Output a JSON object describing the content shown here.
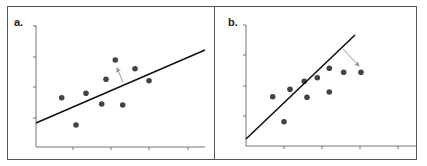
{
  "panels": [
    {
      "label": "a.",
      "line": {
        "x1": 36,
        "y1": 123,
        "x2": 205,
        "y2": 50
      },
      "points": [
        [
          61.7,
          97.7
        ],
        [
          76,
          125
        ],
        [
          86,
          93.3
        ],
        [
          101.7,
          104
        ],
        [
          106,
          79.3
        ],
        [
          115.3,
          60
        ],
        [
          122.7,
          105
        ],
        [
          135,
          68.7
        ],
        [
          149,
          80.7
        ]
      ],
      "arrow": {
        "x1": 123,
        "y1": 82,
        "x2": 117,
        "y2": 68
      },
      "axis": {
        "x": 36,
        "ytop": 25,
        "ybottom": 147,
        "xright": 205,
        "yticks": [
          26,
          57,
          87,
          118
        ],
        "xticks": [
          73,
          111,
          149,
          188
        ]
      }
    },
    {
      "label": "b.",
      "line": {
        "x1": 246,
        "y1": 139,
        "x2": 355,
        "y2": 35
      },
      "points": [
        [
          272.7,
          96.7
        ],
        [
          284,
          121.7
        ],
        [
          290,
          89.3
        ],
        [
          304.3,
          81.3
        ],
        [
          307,
          97.3
        ],
        [
          317.3,
          77.7
        ],
        [
          329.3,
          68.3
        ],
        [
          329.3,
          92
        ],
        [
          343.7,
          72.3
        ],
        [
          361,
          72.3
        ]
      ],
      "arrow": {
        "x1": 343,
        "y1": 49,
        "x2": 359,
        "y2": 66
      },
      "axis": {
        "x": 246,
        "ytop": 25,
        "ybottom": 146,
        "xright": 416,
        "yticks": [
          25,
          55,
          86,
          116
        ],
        "xticks": [
          284,
          322,
          360,
          398
        ]
      }
    }
  ],
  "colors": {
    "frame": "#555555",
    "axis": "#777777",
    "point": "#444444",
    "line": "#111111",
    "arrow": "#999999"
  },
  "chart_data": [
    {
      "type": "scatter",
      "title": "a.",
      "description": "Scatter with fitted regression line (shallow slope); arrow shows residual from line toward a point",
      "x": [
        61.7,
        76,
        86,
        101.7,
        106,
        115.3,
        122.7,
        135,
        149
      ],
      "y": [
        97.7,
        125,
        93.3,
        104,
        79.3,
        60,
        105,
        68.7,
        80.7
      ],
      "xlabel": "",
      "ylabel": "",
      "grid": false
    },
    {
      "type": "scatter",
      "title": "b.",
      "description": "Same-style scatter with steeper fitted line; arrow shows residual from line toward a point",
      "x": [
        272.7,
        284,
        290,
        304.3,
        307,
        317.3,
        329.3,
        329.3,
        343.7,
        361
      ],
      "y": [
        96.7,
        121.7,
        89.3,
        81.3,
        97.3,
        77.7,
        68.3,
        92,
        72.3,
        72.3
      ],
      "xlabel": "",
      "ylabel": "",
      "grid": false
    }
  ]
}
